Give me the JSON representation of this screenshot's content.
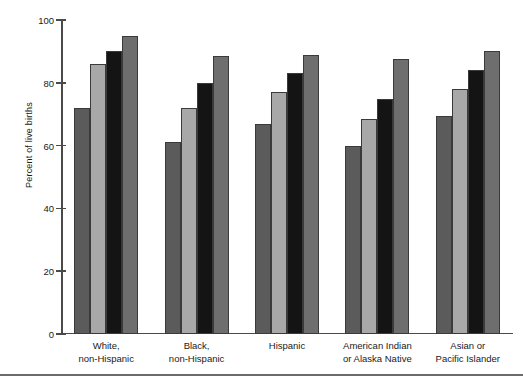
{
  "figure": {
    "ylabel": "Percent of live births",
    "bottom_rule": true
  },
  "chart_data": {
    "type": "bar",
    "title": "",
    "xlabel": "",
    "ylabel": "Percent of live births",
    "ylim": [
      0,
      100
    ],
    "yticks": [
      0,
      20,
      40,
      60,
      80,
      100
    ],
    "ytick_labels": [
      "0",
      "20",
      "40",
      "60",
      "80",
      "100"
    ],
    "grid": false,
    "legend": "none",
    "categories": [
      "White,\nnon-Hispanic",
      "Black,\nnon-Hispanic",
      "Hispanic",
      "American Indian\nor Alaska Native",
      "Asian or\nPacific Islander"
    ],
    "category_lines": [
      [
        "White,",
        "non-Hispanic"
      ],
      [
        "Black,",
        "non-Hispanic"
      ],
      [
        "Hispanic",
        ""
      ],
      [
        "American Indian",
        "or Alaska Native"
      ],
      [
        "Asian or",
        "Pacific Islander"
      ]
    ],
    "series": [
      {
        "name": "series-1",
        "color": "#5b5b5b",
        "values": [
          72.0,
          61.0,
          67.0,
          60.0,
          69.5
        ]
      },
      {
        "name": "series-2",
        "color": "#a8a8a8",
        "values": [
          86.0,
          72.0,
          77.0,
          68.5,
          78.0
        ]
      },
      {
        "name": "series-3",
        "color": "#141414",
        "values": [
          90.0,
          80.0,
          83.0,
          75.0,
          84.0
        ]
      },
      {
        "name": "series-4",
        "color": "#6e6e6e",
        "values": [
          95.0,
          88.5,
          89.0,
          87.5,
          90.0
        ]
      }
    ]
  }
}
